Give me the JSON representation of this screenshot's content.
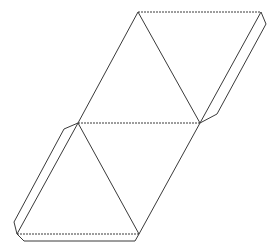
{
  "diagram": {
    "type": "net",
    "colors": {
      "line": "#3a3a3a",
      "background": "#ffffff"
    },
    "vertices": {
      "A": [
        138,
        12
      ],
      "B": [
        261,
        12
      ],
      "C": [
        78,
        123
      ],
      "D": [
        200,
        123
      ],
      "E": [
        17,
        234
      ],
      "F": [
        139,
        234
      ]
    },
    "faces": [
      {
        "name": "top-left-triangle",
        "points": [
          "A",
          "C",
          "D"
        ]
      },
      {
        "name": "top-right-triangle",
        "points": [
          "A",
          "B",
          "D"
        ]
      },
      {
        "name": "bottom-left-triangle",
        "points": [
          "C",
          "E",
          "F"
        ]
      },
      {
        "name": "bottom-right-triangle",
        "points": [
          "C",
          "D",
          "F"
        ]
      }
    ],
    "fold_lines": [
      {
        "name": "top-fold",
        "from": "A",
        "to": "B",
        "style": "dashed"
      },
      {
        "name": "middle-fold",
        "from": "C",
        "to": "D",
        "style": "dashed"
      },
      {
        "name": "bottom-fold",
        "from": "E",
        "to": "F",
        "style": "dashed"
      }
    ],
    "tabs": [
      {
        "name": "right-tab",
        "points": [
          [
            261,
            12
          ],
          [
            266,
            24
          ],
          [
            217,
            114
          ],
          [
            200,
            123
          ]
        ]
      },
      {
        "name": "left-tab",
        "points": [
          [
            78,
            123
          ],
          [
            64,
            129
          ],
          [
            14,
            222
          ],
          [
            17,
            234
          ]
        ]
      },
      {
        "name": "bottom-tab",
        "points": [
          [
            17,
            234
          ],
          [
            24,
            241
          ],
          [
            135,
            241
          ],
          [
            139,
            234
          ]
        ]
      }
    ]
  }
}
